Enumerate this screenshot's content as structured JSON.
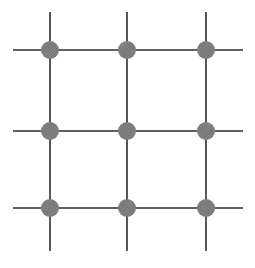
{
  "diagram": {
    "type": "grid-lattice",
    "rows": 3,
    "cols": 3,
    "col_x": [
      50,
      127,
      206
    ],
    "row_y": [
      50,
      131,
      208
    ],
    "h_line_extent": [
      13,
      243
    ],
    "v_line_extent": [
      12,
      251
    ],
    "node_radius": 9,
    "colors": {
      "line": "#2b2b2b",
      "node_fill": "#8c8c8c",
      "node_hatch": "#6e6e6e",
      "background": "#ffffff"
    }
  }
}
